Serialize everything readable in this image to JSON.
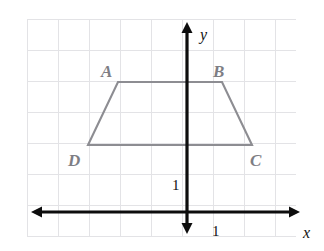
{
  "figure": {
    "background_color": "#ffffff",
    "grid": {
      "color": "#e3e3e6",
      "visible": true,
      "spacing_px": 31,
      "columns": 9,
      "rows": 7,
      "left_px": 27,
      "top_px": 19,
      "right_px": 296,
      "bottom_px": 236
    },
    "axes": {
      "color": "#0d0d0d",
      "x_axis": {
        "label": "x",
        "y_px": 212,
        "x_start_px": 31,
        "x_end_px": 300,
        "arrows": "both"
      },
      "y_axis": {
        "label": "y",
        "x_px": 187,
        "y_start_px": 22,
        "y_end_px": 234,
        "arrows": "both"
      },
      "unit_marks": {
        "y_unit_label": "1",
        "y_unit_x_px": 172,
        "y_unit_y_px": 190,
        "x_unit_label": "1",
        "x_unit_x_px": 212,
        "x_unit_y_px": 236
      }
    },
    "shape": {
      "name": "trapezoid",
      "stroke_color": "#8d8d92",
      "fill": "none",
      "closed": true,
      "vertices": [
        {
          "id": "A",
          "x_px": 118,
          "y_px": 82,
          "grid_x": -2,
          "grid_y": 4
        },
        {
          "id": "B",
          "x_px": 222,
          "y_px": 82,
          "grid_x": 1,
          "grid_y": 4
        },
        {
          "id": "C",
          "x_px": 252,
          "y_px": 145,
          "grid_x": 2,
          "grid_y": 2
        },
        {
          "id": "D",
          "x_px": 88,
          "y_px": 145,
          "grid_x": -3,
          "grid_y": 2
        }
      ],
      "labels": [
        {
          "id": "A",
          "text": "A",
          "x_px": 101,
          "y_px": 77
        },
        {
          "id": "B",
          "text": "B",
          "x_px": 213,
          "y_px": 77
        },
        {
          "id": "C",
          "text": "C",
          "x_px": 250,
          "y_px": 166
        },
        {
          "id": "D",
          "text": "D",
          "x_px": 68,
          "y_px": 166
        }
      ]
    }
  },
  "chart_data": {
    "type": "scatter",
    "xlabel": "x",
    "ylabel": "y",
    "grid": true,
    "xlim": [
      -5,
      4
    ],
    "ylim": [
      -1,
      6
    ],
    "tick_unit": 1,
    "annotations": [
      "1",
      "1"
    ],
    "series": [
      {
        "name": "Trapezoid ABCD",
        "closed": true,
        "point_labels": [
          "A",
          "B",
          "C",
          "D"
        ],
        "x": [
          -2,
          1,
          2,
          -3
        ],
        "y": [
          4,
          4,
          2,
          2
        ]
      }
    ]
  }
}
